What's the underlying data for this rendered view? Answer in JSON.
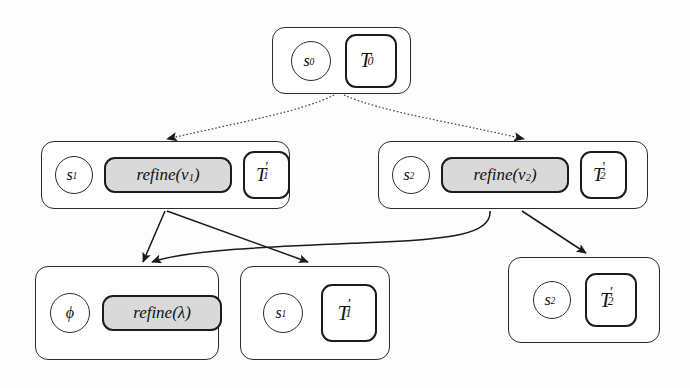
{
  "diagram": {
    "background_color": "#fdfdfd",
    "stroke_color": "#2b2b2b",
    "refine_fill_color": "#d9d9d9",
    "nodes": [
      {
        "id": "root",
        "state": "s",
        "state_sub": "0",
        "tree": "T",
        "tree_sub": "0",
        "tree_prime": "",
        "refine": null
      },
      {
        "id": "mid-left",
        "state": "s",
        "state_sub": "1",
        "tree": "T",
        "tree_sub": "1",
        "tree_prime": "′",
        "refine": "refine(v",
        "refine_sub": "1",
        "refine_close": ")"
      },
      {
        "id": "mid-right",
        "state": "s",
        "state_sub": "2",
        "tree": "T",
        "tree_sub": "2",
        "tree_prime": "′",
        "refine": "refine(v",
        "refine_sub": "2",
        "refine_close": ")"
      },
      {
        "id": "bot-left",
        "state": "ϕ",
        "state_sub": "",
        "tree": null,
        "tree_sub": "",
        "tree_prime": "",
        "refine": "refine(λ",
        "refine_sub": "",
        "refine_close": ")"
      },
      {
        "id": "bot-mid",
        "state": "s",
        "state_sub": "1",
        "tree": "T",
        "tree_sub": "1",
        "tree_prime": "′",
        "refine": null
      },
      {
        "id": "bot-right",
        "state": "s",
        "state_sub": "2",
        "tree": "T",
        "tree_sub": "2",
        "tree_prime": "′",
        "refine": null
      }
    ],
    "edges": [
      {
        "from": "root",
        "to": "mid-left",
        "style": "dotted-curve"
      },
      {
        "from": "root",
        "to": "mid-right",
        "style": "dotted-curve"
      },
      {
        "from": "mid-left",
        "to": "bot-left",
        "style": "straight"
      },
      {
        "from": "mid-left",
        "to": "bot-mid",
        "style": "straight"
      },
      {
        "from": "mid-right",
        "to": "bot-left",
        "style": "curve"
      },
      {
        "from": "mid-right",
        "to": "bot-right",
        "style": "straight"
      }
    ]
  }
}
